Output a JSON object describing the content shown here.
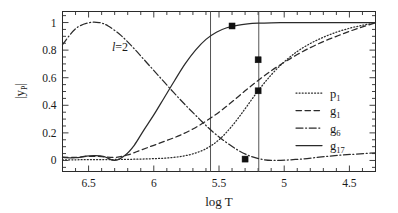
{
  "figure": {
    "annotation": "l=2",
    "annotation_symbol": "l",
    "annotation_rest": "=2"
  },
  "axes": {
    "x": {
      "title": "log T",
      "tick_labels": [
        "6.5",
        "6",
        "5.5",
        "5",
        "4.5"
      ],
      "tick_values": [
        6.5,
        6.0,
        5.5,
        5.0,
        4.5
      ],
      "range": [
        6.7,
        4.3
      ],
      "reversed": true,
      "minor_tick_step": 0.1
    },
    "y": {
      "title": "|y_P|",
      "title_parts": {
        "main": "|y",
        "sub": "P",
        "tail": "|"
      },
      "tick_labels": [
        "0",
        "0.2",
        "0.4",
        "0.6",
        "0.8",
        "1"
      ],
      "tick_values": [
        0,
        0.2,
        0.4,
        0.6,
        0.8,
        1.0
      ],
      "range": [
        -0.08,
        1.08
      ],
      "minor_tick_step": 0.05
    }
  },
  "legend": {
    "position": "center-right",
    "entries": [
      {
        "label": "p",
        "sub": "1",
        "style": "dotted"
      },
      {
        "label": "g",
        "sub": "1",
        "style": "dashed"
      },
      {
        "label": "g",
        "sub": "6",
        "style": "dashdot"
      },
      {
        "label": "g",
        "sub": "17",
        "style": "solid"
      }
    ]
  },
  "chart_data": {
    "type": "line",
    "title": "",
    "xlabel": "log T",
    "ylabel": "|y_P|",
    "xlim": [
      6.7,
      4.3
    ],
    "ylim": [
      -0.08,
      1.08
    ],
    "x_reversed": true,
    "grid": false,
    "legend_position": "center-right",
    "annotations": [
      {
        "text": "l=2",
        "x": 6.12,
        "y": 0.905
      }
    ],
    "vertical_lines": [
      {
        "x": 5.565,
        "style": "solid",
        "color": "#555555"
      },
      {
        "x": 5.195,
        "style": "solid",
        "color": "#555555"
      }
    ],
    "markers": [
      {
        "series": "g_17",
        "x": 5.4,
        "y": 0.975
      },
      {
        "series": "g_1",
        "x": 5.2,
        "y": 0.73
      },
      {
        "series": "p_1",
        "x": 5.2,
        "y": 0.505
      },
      {
        "series": "g_6",
        "x": 5.3,
        "y": 0.01
      }
    ],
    "series": [
      {
        "name": "p_1",
        "style": "dotted",
        "x": [
          6.7,
          6.6,
          6.5,
          6.4,
          6.3,
          6.2,
          6.1,
          6.0,
          5.9,
          5.8,
          5.7,
          5.6,
          5.5,
          5.4,
          5.3,
          5.2,
          5.1,
          5.0,
          4.9,
          4.8,
          4.7,
          4.6,
          4.5,
          4.4,
          4.3
        ],
        "y": [
          0.005,
          0.005,
          0.006,
          0.006,
          0.007,
          0.008,
          0.01,
          0.013,
          0.018,
          0.028,
          0.048,
          0.085,
          0.15,
          0.25,
          0.375,
          0.505,
          0.62,
          0.715,
          0.79,
          0.848,
          0.893,
          0.93,
          0.958,
          0.98,
          0.998
        ]
      },
      {
        "name": "g_1",
        "style": "dashed",
        "x": [
          6.7,
          6.6,
          6.5,
          6.4,
          6.3,
          6.2,
          6.1,
          6.0,
          5.9,
          5.8,
          5.7,
          5.6,
          5.5,
          5.4,
          5.3,
          5.2,
          5.1,
          5.0,
          4.9,
          4.8,
          4.7,
          4.6,
          4.5,
          4.4,
          4.3
        ],
        "y": [
          0.025,
          0.022,
          0.03,
          0.028,
          0.022,
          0.04,
          0.075,
          0.11,
          0.145,
          0.182,
          0.228,
          0.285,
          0.35,
          0.425,
          0.505,
          0.58,
          0.65,
          0.712,
          0.768,
          0.818,
          0.862,
          0.9,
          0.936,
          0.968,
          0.998
        ]
      },
      {
        "name": "g_6",
        "style": "dashdot",
        "x": [
          6.7,
          6.6,
          6.5,
          6.42,
          6.35,
          6.25,
          6.15,
          6.05,
          5.95,
          5.85,
          5.75,
          5.65,
          5.55,
          5.45,
          5.35,
          5.25,
          5.15,
          5.05,
          4.95,
          4.85,
          4.75,
          4.65,
          4.55,
          4.45,
          4.3
        ],
        "y": [
          0.84,
          0.955,
          0.998,
          1.0,
          0.975,
          0.905,
          0.81,
          0.705,
          0.6,
          0.495,
          0.395,
          0.3,
          0.21,
          0.135,
          0.072,
          0.028,
          0.005,
          0.0,
          0.005,
          0.012,
          0.022,
          0.032,
          0.04,
          0.046,
          0.055
        ]
      },
      {
        "name": "g_17",
        "style": "solid",
        "x": [
          6.7,
          6.6,
          6.52,
          6.45,
          6.38,
          6.3,
          6.22,
          6.15,
          6.08,
          6.0,
          5.92,
          5.84,
          5.76,
          5.68,
          5.6,
          5.52,
          5.44,
          5.36,
          5.28,
          5.2,
          5.1,
          5.0,
          4.8,
          4.6,
          4.3
        ],
        "y": [
          0.022,
          0.02,
          0.032,
          0.035,
          0.028,
          0.0,
          0.038,
          0.11,
          0.215,
          0.33,
          0.455,
          0.58,
          0.7,
          0.8,
          0.878,
          0.93,
          0.962,
          0.98,
          0.99,
          0.995,
          0.998,
          0.999,
          1.0,
          1.0,
          1.0
        ]
      }
    ]
  }
}
